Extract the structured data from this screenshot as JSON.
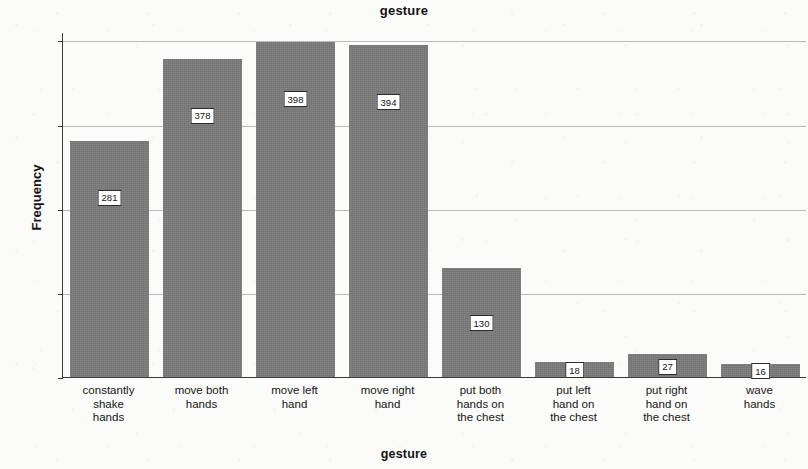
{
  "chart_data": {
    "type": "bar",
    "title": "gesture",
    "xlabel": "gesture",
    "ylabel": "Frequency",
    "categories": [
      "constantly\nshake\nhands",
      "move both\nhands",
      "move left\nhand",
      "move right\nhand",
      "put both\nhands on\nthe chest",
      "put left\nhand on\nthe chest",
      "put right\nhand on\nthe chest",
      "wave\nhands"
    ],
    "values": [
      281,
      378,
      398,
      394,
      130,
      18,
      27,
      16
    ],
    "data_labels": [
      "281",
      "378",
      "398",
      "394",
      "130",
      "18",
      "27",
      "16"
    ],
    "ylim": [
      0,
      410
    ],
    "yticks": [
      0,
      100,
      200,
      300,
      400
    ],
    "ytick_labels": [
      "0",
      "100",
      "200",
      "300",
      "400"
    ],
    "grid": "horizontal",
    "legend": "none",
    "bar_color": "#7a7a7a",
    "background_color": "#fbfbfa",
    "axis_color": "#3a3a3a",
    "gridline_color": "#b9b9b9"
  }
}
